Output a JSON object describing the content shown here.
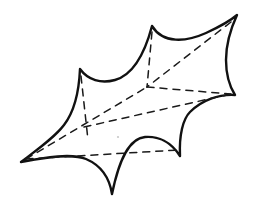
{
  "figure": {
    "background_color": "#ffffff",
    "outline_color": "#111111",
    "dashed_color": "#1a1a1a",
    "outline_width": 2.4,
    "dashed_width": 1.5,
    "dash_pattern": "7 6",
    "canvas": {
      "width": 258,
      "height": 213
    },
    "vertices": [
      {
        "name": "top-spike",
        "x": 152,
        "y": 26
      },
      {
        "name": "top-right-tip",
        "x": 237,
        "y": 15
      },
      {
        "name": "right-tip",
        "x": 235,
        "y": 95
      },
      {
        "name": "lower-right-spike",
        "x": 180,
        "y": 156
      },
      {
        "name": "bottom-spike",
        "x": 112,
        "y": 194
      },
      {
        "name": "left-tip",
        "x": 21,
        "y": 162
      },
      {
        "name": "upper-left-spike",
        "x": 80,
        "y": 69
      }
    ],
    "outline_path": "M 152 26 C 163 44 186 42 206 33 C 219 27 230 21 237 15 C 231 28 226 45 226 60 C 226 75 230 87 235 95 C 219 94 202 100 190 112 C 183 119 179 135 180 156 C 171 142 158 136 145 137 C 133 138 121 150 112 194 C 109 175 100 165 86 159 C 72 153 46 157 21 162 C 38 149 54 138 64 125 C 74 112 79 92 80 69 C 88 80 101 84 115 80 C 129 76 143 60 152 26 Z",
    "dashed_segments": [
      {
        "name": "top-spike-to-center",
        "x1": 152,
        "y1": 32,
        "x2": 147,
        "y2": 87
      },
      {
        "name": "top-right-tip-to-center",
        "x1": 231,
        "y1": 22,
        "x2": 147,
        "y2": 87
      },
      {
        "name": "center-to-right-tip",
        "x1": 147,
        "y1": 87,
        "x2": 231,
        "y2": 94
      },
      {
        "name": "upper-left-spike-to-lower",
        "x1": 81,
        "y1": 76,
        "x2": 88,
        "y2": 140
      },
      {
        "name": "upper-left-to-right-tip",
        "x1": 84,
        "y1": 127,
        "x2": 231,
        "y2": 94
      },
      {
        "name": "left-tip-to-center",
        "x1": 26,
        "y1": 159,
        "x2": 147,
        "y2": 87
      },
      {
        "name": "left-tip-to-lower-right-spike",
        "x1": 26,
        "y1": 159,
        "x2": 178,
        "y2": 150
      }
    ],
    "speck": {
      "name": "paper-speck",
      "x": 118,
      "y": 137,
      "r": 1.1
    }
  }
}
